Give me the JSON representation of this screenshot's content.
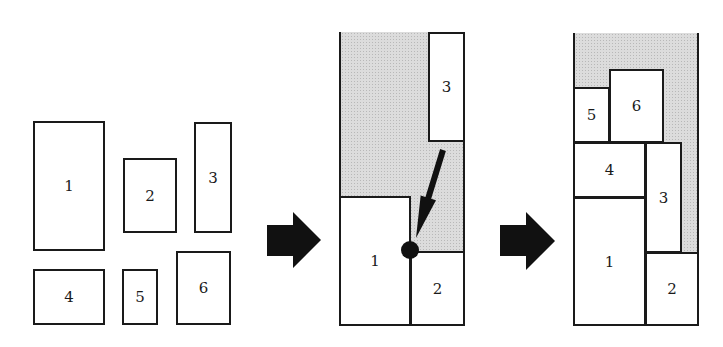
{
  "diagram": {
    "colors": {
      "stroke": "#1a1a1a",
      "fill": "#ffffff",
      "free_space": "#dcdcdc"
    },
    "stage1": {
      "name": "loose-rectangles",
      "rects": [
        {
          "label": "1",
          "x": 33,
          "y": 121,
          "w": 72,
          "h": 130
        },
        {
          "label": "2",
          "x": 123,
          "y": 158,
          "w": 54,
          "h": 75
        },
        {
          "label": "3",
          "x": 194,
          "y": 122,
          "w": 38,
          "h": 111
        },
        {
          "label": "4",
          "x": 33,
          "y": 269,
          "w": 72,
          "h": 56
        },
        {
          "label": "5",
          "x": 122,
          "y": 269,
          "w": 36,
          "h": 56
        },
        {
          "label": "6",
          "x": 176,
          "y": 251,
          "w": 55,
          "h": 74
        }
      ]
    },
    "arrow1": {
      "icon": "right-arrow-icon"
    },
    "stage2": {
      "name": "partial-packing",
      "bin": {
        "x": 339,
        "y": 32,
        "w": 126,
        "h": 294
      },
      "rects": [
        {
          "label": "1",
          "x": 339,
          "y": 196,
          "w": 72,
          "h": 130
        },
        {
          "label": "2",
          "x": 410,
          "y": 251,
          "w": 55,
          "h": 75
        },
        {
          "label": "3",
          "x": 428,
          "y": 32,
          "w": 37,
          "h": 110
        }
      ],
      "placement_point": {
        "x": 410,
        "y": 250,
        "r": 9
      },
      "pointer_arrow": {
        "from": [
          443,
          150
        ],
        "to": [
          416,
          238
        ],
        "icon": "placement-arrow-icon"
      }
    },
    "arrow2": {
      "icon": "right-arrow-icon"
    },
    "stage3": {
      "name": "final-packing",
      "bin": {
        "x": 573,
        "y": 33,
        "w": 126,
        "h": 293
      },
      "rects": [
        {
          "label": "5",
          "x": 573,
          "y": 87,
          "w": 37,
          "h": 56
        },
        {
          "label": "6",
          "x": 609,
          "y": 69,
          "w": 55,
          "h": 74
        },
        {
          "label": "4",
          "x": 573,
          "y": 142,
          "w": 73,
          "h": 56
        },
        {
          "label": "3",
          "x": 645,
          "y": 142,
          "w": 37,
          "h": 111
        },
        {
          "label": "1",
          "x": 573,
          "y": 197,
          "w": 73,
          "h": 129
        },
        {
          "label": "2",
          "x": 645,
          "y": 252,
          "w": 54,
          "h": 74
        }
      ]
    }
  }
}
